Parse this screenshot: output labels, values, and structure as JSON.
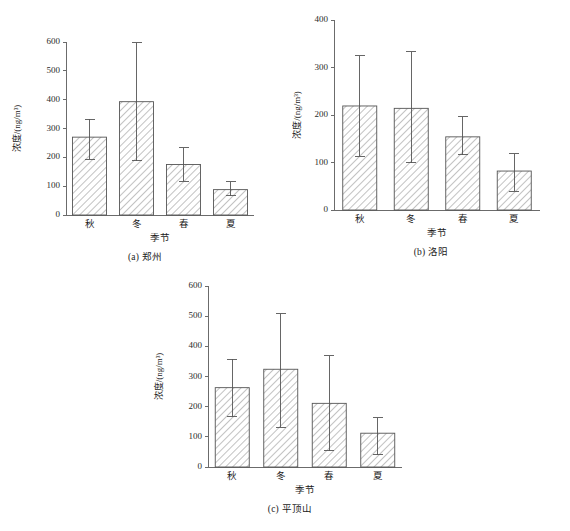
{
  "figure": {
    "axis_title_x": "季节",
    "axis_title_y": "浓度/(ng/m³)",
    "categories": [
      "秋",
      "冬",
      "春",
      "夏"
    ]
  },
  "chart_data": [
    {
      "type": "bar",
      "panel": "a",
      "title": "(a) 郑州",
      "xlabel": "季节",
      "ylabel": "浓度/(ng/m³)",
      "categories": [
        "秋",
        "冬",
        "春",
        "夏"
      ],
      "values": [
        270,
        393,
        175,
        88
      ],
      "error_upper": [
        332,
        598,
        233,
        115
      ],
      "error_lower": [
        193,
        188,
        117,
        66
      ],
      "ylim": [
        0,
        600
      ],
      "yticks": [
        0,
        100,
        200,
        300,
        400,
        500,
        600
      ],
      "grid": false,
      "legend": "none"
    },
    {
      "type": "bar",
      "panel": "b",
      "title": "(b) 洛阳",
      "xlabel": "季节",
      "ylabel": "浓度/(ng/m³)",
      "categories": [
        "秋",
        "冬",
        "春",
        "夏"
      ],
      "values": [
        219,
        214,
        154,
        82
      ],
      "error_upper": [
        325,
        333,
        196,
        118
      ],
      "error_lower": [
        113,
        99,
        116,
        40
      ],
      "ylim": [
        0,
        400
      ],
      "yticks": [
        0,
        100,
        200,
        300,
        400
      ],
      "grid": false,
      "legend": "none"
    },
    {
      "type": "bar",
      "panel": "c",
      "title": "(c) 平顶山",
      "xlabel": "季节",
      "ylabel": "浓度/(ng/m³)",
      "categories": [
        "秋",
        "冬",
        "春",
        "夏"
      ],
      "values": [
        263,
        324,
        211,
        112
      ],
      "error_upper": [
        358,
        508,
        368,
        163
      ],
      "error_lower": [
        166,
        131,
        54,
        40
      ],
      "ylim": [
        0,
        600
      ],
      "yticks": [
        0,
        100,
        200,
        300,
        400,
        500,
        600
      ],
      "grid": false,
      "legend": "none"
    }
  ]
}
